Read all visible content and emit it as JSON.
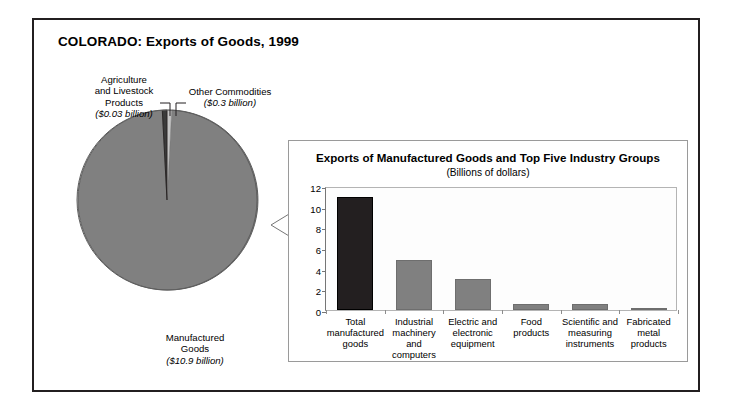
{
  "figure": {
    "title": "COLORADO: Exports of Goods, 1999"
  },
  "pie": {
    "slices": [
      {
        "name": "Manufactured Goods",
        "label_line1": "Manufactured",
        "label_line2": "Goods",
        "amount_label": "($10.9 billion)",
        "value": 10.9,
        "color": "#808080"
      },
      {
        "name": "Other Commodities",
        "label_line1": "Other Commodities",
        "label_line2": "",
        "amount_label": "($0.3 billion)",
        "value": 0.3,
        "color": "#c4c4c4"
      },
      {
        "name": "Agriculture and Livestock Products",
        "label_line1": "Agriculture",
        "label_line2": "and Livestock",
        "label_line3": "Products",
        "amount_label": "($0.03 billion)",
        "value": 0.03,
        "color": "#3a3a3a"
      }
    ]
  },
  "bar_panel": {
    "title": "Exports of Manufactured Goods and Top Five Industry Groups",
    "subtitle": "(Billions of dollars)"
  },
  "chart_data": {
    "type": "bar",
    "title": "Exports of Manufactured Goods and Top Five Industry Groups",
    "subtitle": "(Billions of dollars)",
    "xlabel": "",
    "ylabel": "",
    "ylim": [
      0,
      12
    ],
    "yticks": [
      0,
      2,
      4,
      6,
      8,
      10,
      12
    ],
    "grid": false,
    "legend": "none",
    "categories": [
      "Total manufactured goods",
      "Industrial machinery and computers",
      "Electric and electronic equipment",
      "Food products",
      "Scientific and measuring instruments",
      "Fabricated metal products"
    ],
    "category_lines": [
      [
        "Total",
        "manufactured",
        "goods"
      ],
      [
        "Industrial",
        "machinery and",
        "computers"
      ],
      [
        "Electric and",
        "electronic",
        "equipment"
      ],
      [
        "Food products"
      ],
      [
        "Scientific and",
        "measuring",
        "instruments"
      ],
      [
        "Fabricated",
        "metal",
        "products"
      ]
    ],
    "values": [
      10.9,
      4.8,
      3.0,
      0.6,
      0.6,
      0.15
    ],
    "bar_colors": [
      "#231f20",
      "#808080",
      "#808080",
      "#808080",
      "#808080",
      "#808080"
    ]
  },
  "secondary_pie_chart": {
    "type": "pie",
    "title": "COLORADO: Exports of Goods, 1999",
    "labels": [
      "Manufactured Goods",
      "Other Commodities",
      "Agriculture and Livestock Products"
    ],
    "values": [
      10.9,
      0.3,
      0.03
    ],
    "unit": "billions of dollars"
  }
}
